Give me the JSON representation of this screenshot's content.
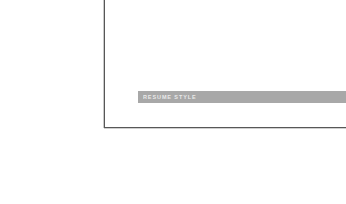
{
  "page": {
    "background_color": "#ffffff",
    "width": 346,
    "height": 204
  },
  "frame": {
    "name": "corner-rule",
    "color": "#575757",
    "ghost_color": "#c9c9c9",
    "vertical_rule_x": 104,
    "horizontal_rule_y": 127,
    "corner": "bottom-left"
  },
  "section_band": {
    "label": "RESUME STYLE",
    "background_color": "#a8a8a8",
    "text_color": "#efefef",
    "left": 138,
    "top": 91,
    "height": 12
  }
}
